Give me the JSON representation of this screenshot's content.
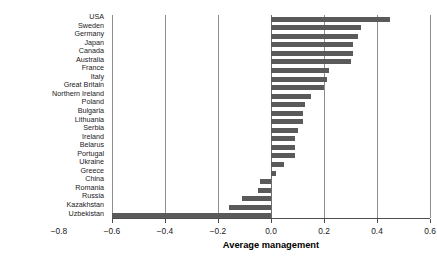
{
  "chart_data": {
    "type": "bar",
    "orientation": "horizontal",
    "title": "",
    "xlabel": "Average management",
    "ylabel": "",
    "xlim": [
      -0.8,
      0.6
    ],
    "ylim": [
      0,
      24
    ],
    "grid": true,
    "gridlines_x": [
      -0.6,
      -0.4,
      -0.2,
      0.0,
      0.2,
      0.4,
      0.6
    ],
    "legend": "none",
    "xticks": [
      -0.8,
      -0.6,
      -0.4,
      -0.2,
      0.0,
      0.2,
      0.4,
      0.6
    ],
    "xticklabels": [
      "-0.8",
      "-0.6",
      "-0.4",
      "-0.2",
      "0.0",
      "0.2",
      "0.4",
      "0.6"
    ],
    "bar_color": "#5a5a5a",
    "categories": [
      "USA",
      "Sweden",
      "Germany",
      "Japan",
      "Canada",
      "Australia",
      "France",
      "Italy",
      "Great Britain",
      "Northern Ireland",
      "Poland",
      "Bulgaria",
      "Lithuania",
      "Serbia",
      "Ireland",
      "Belarus",
      "Portugal",
      "Ukraine",
      "Greece",
      "China",
      "Romania",
      "Russia",
      "Kazakhstan",
      "Uzbekistan"
    ],
    "values": [
      0.45,
      0.34,
      0.33,
      0.31,
      0.31,
      0.3,
      0.22,
      0.21,
      0.2,
      0.15,
      0.13,
      0.12,
      0.12,
      0.1,
      0.09,
      0.09,
      0.09,
      0.05,
      0.02,
      -0.04,
      -0.05,
      -0.11,
      -0.16,
      -0.6
    ]
  }
}
